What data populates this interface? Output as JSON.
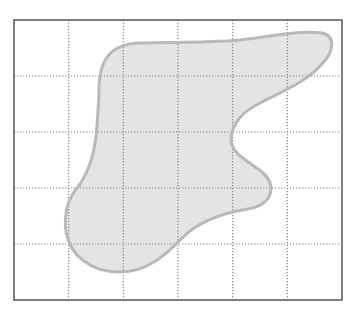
{
  "diagram": {
    "type": "grid-area-shape",
    "background": "#ffffff",
    "frame": {
      "x": 14,
      "y": 20,
      "width": 328,
      "height": 280,
      "stroke": "#555555",
      "stroke_width": 1.5
    },
    "grid": {
      "columns": 6,
      "rows": 5,
      "line_color": "#8a8a8a",
      "line_style": "dotted"
    },
    "shape": {
      "fill": "#e4e4e4",
      "stroke": "#b9b9b9",
      "stroke_width": 3,
      "description": "irregular blob shape covering part of the grid",
      "path": "M 99 90 C 99 60, 110 44, 140 43 C 175 42, 205 43, 240 40 C 275 36, 300 30, 322 33 C 336 36, 334 52, 322 64 C 306 82, 285 90, 262 102 C 242 112, 233 122, 231 138 C 230 154, 250 162, 262 172 C 278 186, 272 205, 248 209 C 222 213, 198 222, 182 238 C 165 256, 146 272, 120 272 C 90 272, 70 255, 66 232 C 63 210, 70 196, 80 184 C 92 166, 96 145, 97 125 C 98 110, 99 100, 99 90 Z"
    }
  }
}
